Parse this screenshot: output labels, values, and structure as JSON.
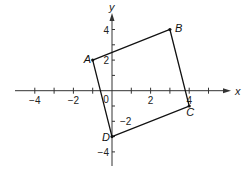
{
  "axes": {
    "x_label": "x",
    "y_label": "y",
    "origin_label": "0",
    "x_ticks": [
      {
        "v": -4,
        "label": "−4"
      },
      {
        "v": -2,
        "label": "−2"
      },
      {
        "v": 2,
        "label": "2"
      },
      {
        "v": 4,
        "label": "4"
      }
    ],
    "y_ticks": [
      {
        "v": 4,
        "label": "4"
      },
      {
        "v": 2,
        "label": "2"
      },
      {
        "v": -2,
        "label": "−2"
      },
      {
        "v": -4,
        "label": "−4"
      }
    ],
    "x_range": [
      -5,
      6
    ],
    "y_range": [
      -5,
      5
    ]
  },
  "figure": {
    "shape": "quadrilateral ABCD",
    "points": [
      {
        "name": "A",
        "x": -1,
        "y": 2
      },
      {
        "name": "B",
        "x": 3,
        "y": 4
      },
      {
        "name": "C",
        "x": 4,
        "y": -1
      },
      {
        "name": "D",
        "x": 0,
        "y": -3
      }
    ]
  }
}
